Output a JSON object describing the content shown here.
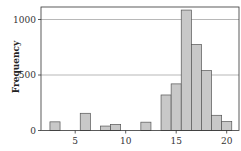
{
  "chart_data": {
    "type": "bar",
    "title": "",
    "xlabel": "",
    "ylabel": "Frequency",
    "x": [
      3,
      6,
      8,
      9,
      12,
      14,
      15,
      16,
      17,
      18,
      19,
      20
    ],
    "values": [
      78,
      155,
      40,
      55,
      75,
      320,
      420,
      1085,
      775,
      540,
      137,
      80
    ],
    "bin_width": 1,
    "xlim": [
      1.5,
      21.3
    ],
    "ylim": [
      0,
      1110
    ],
    "xticks": [
      5,
      10,
      15,
      20
    ],
    "yticks": [
      0,
      500,
      1000
    ],
    "grid": {
      "y": true,
      "x": false,
      "lines_at": [
        500,
        1000
      ]
    },
    "legend": null,
    "bar_color": "#c8c8c8",
    "edge_color": "#555555"
  },
  "labels": {
    "ylabel": "Frequency"
  }
}
